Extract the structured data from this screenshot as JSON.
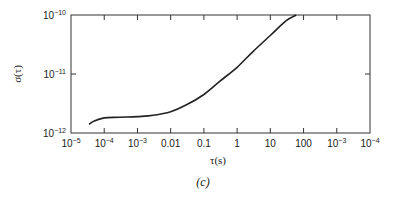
{
  "chart_data": {
    "type": "line",
    "title": "",
    "caption": "(c)",
    "xlabel": "τ(s)",
    "ylabel": "σ(τ)",
    "xscale": "log",
    "yscale": "log",
    "xlim": [
      1e-05,
      10000.0
    ],
    "ylim": [
      1e-12,
      1e-10
    ],
    "x_tick_labels": [
      "10^-5",
      "10^-4",
      "10^-3",
      "0.01",
      "0.1",
      "1",
      "10",
      "100",
      "10^-3",
      "10^-4"
    ],
    "y_tick_labels": [
      "10^-12",
      "10^-11",
      "10^-10"
    ],
    "grid": false,
    "legend": null,
    "series": [
      {
        "name": "σ(τ)",
        "x": [
          3.5e-05,
          5e-05,
          0.0001,
          0.0003,
          0.001,
          0.003,
          0.01,
          0.03,
          0.1,
          0.3,
          1,
          3,
          10,
          30,
          60
        ],
        "y": [
          1.4e-12,
          1.6e-12,
          1.8e-12,
          1.85e-12,
          1.9e-12,
          2e-12,
          2.3e-12,
          3e-12,
          4.5e-12,
          7.5e-12,
          1.3e-11,
          2.4e-11,
          4.5e-11,
          8e-11,
          1e-10
        ]
      }
    ]
  },
  "labels": {
    "xlabel": "τ(s)",
    "ylabel": "σ(τ)",
    "caption": "(c)",
    "x_ticks": [
      {
        "base": "10",
        "exp": "−5"
      },
      {
        "base": "10",
        "exp": "−4"
      },
      {
        "base": "10",
        "exp": "−3"
      },
      {
        "base": "0.01",
        "exp": ""
      },
      {
        "base": "0.1",
        "exp": ""
      },
      {
        "base": "1",
        "exp": ""
      },
      {
        "base": "10",
        "exp": ""
      },
      {
        "base": "100",
        "exp": ""
      },
      {
        "base": "10",
        "exp": "−3"
      },
      {
        "base": "10",
        "exp": "−4"
      }
    ],
    "y_ticks": [
      {
        "base": "10",
        "exp": "−12"
      },
      {
        "base": "10",
        "exp": "−11"
      },
      {
        "base": "10",
        "exp": "−10"
      }
    ]
  }
}
